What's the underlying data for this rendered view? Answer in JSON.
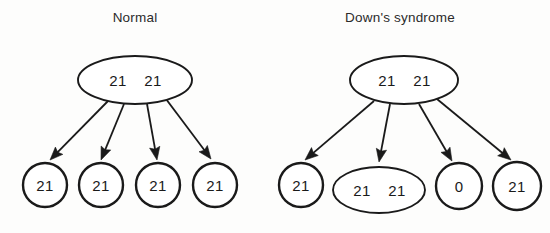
{
  "figure": {
    "title": "",
    "background_color": "#fdfdfc",
    "stroke_color": "#1a1a1a",
    "text_color": "#1a1a1a"
  },
  "panels": [
    {
      "id": "normal",
      "title": "Normal",
      "title_x": 135,
      "title_y": 22,
      "parent": {
        "label_left": "21",
        "label_right": "21",
        "cx": 135,
        "cy": 80,
        "rx": 57,
        "ry": 24
      },
      "children": [
        {
          "label": "21",
          "shape": "circle",
          "cx": 45,
          "cy": 185,
          "rx": 22,
          "ry": 22
        },
        {
          "label": "21",
          "shape": "circle",
          "cx": 101,
          "cy": 185,
          "rx": 22,
          "ry": 22
        },
        {
          "label": "21",
          "shape": "circle",
          "cx": 158,
          "cy": 185,
          "rx": 22,
          "ry": 22
        },
        {
          "label": "21",
          "shape": "circle",
          "cx": 215,
          "cy": 185,
          "rx": 22,
          "ry": 22
        }
      ],
      "arrows": [
        {
          "x1": 108,
          "y1": 101,
          "x2": 50,
          "y2": 160
        },
        {
          "x1": 124,
          "y1": 104,
          "x2": 101,
          "y2": 160
        },
        {
          "x1": 147,
          "y1": 104,
          "x2": 157,
          "y2": 160
        },
        {
          "x1": 166,
          "y1": 99,
          "x2": 211,
          "y2": 159
        }
      ]
    },
    {
      "id": "downs-syndrome",
      "title": "Down's syndrome",
      "title_x": 400,
      "title_y": 22,
      "parent": {
        "label_left": "21",
        "label_right": "21",
        "cx": 404,
        "cy": 80,
        "rx": 54,
        "ry": 24
      },
      "children": [
        {
          "label": "21",
          "shape": "circle",
          "cx": 301,
          "cy": 185,
          "rx": 22,
          "ry": 22
        },
        {
          "label": "21 21",
          "shape": "ellipse",
          "cx": 379,
          "cy": 190,
          "rx": 46,
          "ry": 23
        },
        {
          "label": "0",
          "shape": "circle",
          "cx": 459,
          "cy": 186,
          "rx": 23,
          "ry": 23
        },
        {
          "label": "21",
          "shape": "circle",
          "cx": 517,
          "cy": 186,
          "rx": 24,
          "ry": 24
        }
      ],
      "arrows": [
        {
          "x1": 374,
          "y1": 101,
          "x2": 305,
          "y2": 160
        },
        {
          "x1": 390,
          "y1": 104,
          "x2": 379,
          "y2": 162
        },
        {
          "x1": 419,
          "y1": 104,
          "x2": 452,
          "y2": 161
        },
        {
          "x1": 437,
          "y1": 99,
          "x2": 511,
          "y2": 160
        }
      ]
    }
  ],
  "icons": {
    "arrow": "arrow-down-icon"
  }
}
